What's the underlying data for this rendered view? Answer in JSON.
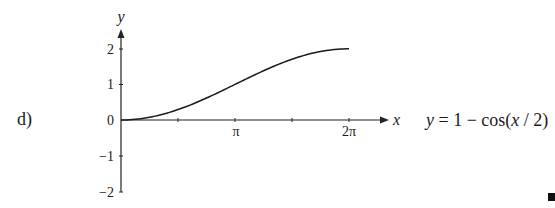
{
  "problem": {
    "label": "d)",
    "equation": {
      "lhs": "y",
      "eq": " = 1 − cos(",
      "arg": "x",
      "rest": " / 2)"
    }
  },
  "chart_data": {
    "type": "line",
    "title": "",
    "function": "y = 1 − cos(x/2)",
    "xlabel": "x",
    "ylabel": "y",
    "xlim": [
      0,
      6.9
    ],
    "ylim": [
      -2,
      2.4
    ],
    "x_ticks": [
      {
        "value": 1.5708,
        "label": ""
      },
      {
        "value": 3.1416,
        "label": "π"
      },
      {
        "value": 4.7124,
        "label": ""
      },
      {
        "value": 6.2832,
        "label": "2π"
      }
    ],
    "y_ticks": [
      {
        "value": 2,
        "label": "2"
      },
      {
        "value": 1,
        "label": "1"
      },
      {
        "value": 0,
        "label": "0"
      },
      {
        "value": -1,
        "label": "−1"
      },
      {
        "value": -2,
        "label": "−2"
      }
    ],
    "series": [
      {
        "name": "y = 1 − cos(x/2)",
        "x": [
          0,
          0.7854,
          1.5708,
          2.3562,
          3.1416,
          3.927,
          4.7124,
          5.4978,
          6.2832
        ],
        "values": [
          0,
          0.0761,
          0.2929,
          0.6173,
          1.0,
          1.3827,
          1.7071,
          1.9239,
          2.0
        ]
      }
    ],
    "grid": false,
    "legend": null
  },
  "labels": {
    "pi": "π",
    "two_pi": "2π",
    "x_axis": "x",
    "y_axis": "y",
    "y2": "2",
    "y1": "1",
    "y0": "0",
    "ym1": "−1",
    "ym2": "−2"
  }
}
